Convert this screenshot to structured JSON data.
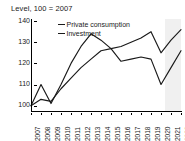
{
  "chart_data": {
    "type": "line",
    "title": "Level, 100 = 2007",
    "xlabel": "",
    "ylabel": "",
    "x": [
      2007,
      2008,
      2009,
      2010,
      2011,
      2012,
      2013,
      2014,
      2015,
      2016,
      2017,
      2018,
      2019,
      2020,
      2021,
      2022
    ],
    "categories": [
      "2007",
      "2008",
      "2009",
      "2010",
      "2011",
      "2012",
      "2013",
      "2014",
      "2015",
      "2016",
      "2017",
      "2018",
      "2019",
      "2020",
      "2021",
      "2022"
    ],
    "series": [
      {
        "name": "Private consumption",
        "values": [
          100,
          103,
          102,
          108,
          113,
          118,
          122,
          126,
          127,
          128,
          130,
          132,
          135,
          125,
          131,
          136
        ],
        "color": "#1a1a1a"
      },
      {
        "name": "Investment",
        "values": [
          100,
          110,
          101,
          110,
          120,
          128,
          134,
          131,
          127,
          121,
          122,
          123,
          122,
          110,
          118,
          126
        ],
        "color": "#1a1a1a"
      }
    ],
    "ylim": [
      97,
      141
    ],
    "yticks": [
      100,
      110,
      120,
      130,
      140
    ],
    "ytick_labels": [
      "100",
      "110",
      "120",
      "130",
      "140"
    ],
    "xlim": [
      2007,
      2022
    ],
    "grid": false,
    "legend_position": "top-left-inside",
    "shaded_region": {
      "label": "forecast",
      "start": 2020.35,
      "end": 2022.6,
      "color": "#f0f0f0"
    }
  }
}
